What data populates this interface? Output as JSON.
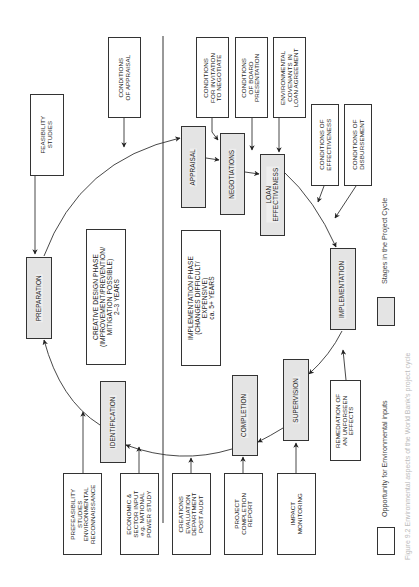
{
  "figure": {
    "caption": "Figure 9.2 Environmental aspects of the World Bank's project cycle"
  },
  "stages": {
    "preparation": "PREPARATION",
    "appraisal": "APPRAISAL",
    "negotiations": "NEGOTIATIONS",
    "loan_effectiveness": "LOAN\nEFFECTIVENESS",
    "implementation": "IMPLEMENTATION",
    "supervision": "SUPERVISION",
    "completion": "COMPLETION",
    "identification": "IDENTIFICATION"
  },
  "inputs": {
    "feasibility_studies": "FEASIBILITY\nSTUDIES",
    "conditions_of_appraisal": "CONDITIONS\nOF APPRAISAL",
    "conditions_invitation": "CONDITIONS\nFOR INVITATION\nTO NEGOTIATE",
    "conditions_board": "CONDITIONS\nOF BOARD\nPRESENTATION",
    "environmental_covenants": "ENVIRONMENTAL\nCOVENANTS IN\nLOAN AGREEMENT",
    "conditions_effectiveness": "CONDITIONS OF\nEFFECTIVENESS",
    "conditions_disbursement": "CONDITIONS OF\nDISBURSEMENT",
    "remediation": "REMEDIATION OF\nAN UNFORSEEN\nEFFECTS",
    "impact_monitoring": "IMPACT\nMONITORING",
    "project_completion_report": "PROJECT\nCOMPLETION\nREPORT",
    "creations_evaluation": "CREATIONS\nEVALUATION\nDEPARTMENT\nPOST AUDIT",
    "economic_sector": "ECONOMIC &\nSECTOR INPUT\ne.g. NATIONAL\nPOWER STUDY",
    "prefeasibility": "PREFEASIBILITY\nSTUDIES\nENVIRONMENTAL\nRECONNAISSANCE"
  },
  "phases": {
    "creative": "CREATIVE DESIGN PHASE\n(IMPROVEMENT/PREVENTION/\nMITIGATION POSSIBLE)\n2–3 YEARS",
    "implementation": "IMPLEMENTATION PHASE\n(CHANGES DIFFICULT/\nEXPENSIVE)\nca. 5+ YEARS"
  },
  "legend": {
    "stages_label": "Stages in the Project Cycle",
    "opportunity_label": "Opportunity for Environmental inputs"
  },
  "colors": {
    "line": "#333333",
    "stage_fill": "#e4e4e4",
    "input_fill": "#ffffff"
  }
}
